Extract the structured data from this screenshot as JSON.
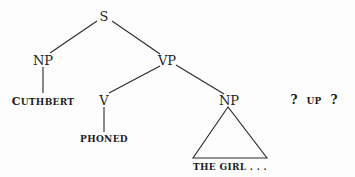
{
  "diagram": {
    "type": "syntax-tree",
    "nodes": {
      "s": "S",
      "np_subject": "NP",
      "vp": "VP",
      "cuthbert": "UTHBERT",
      "cuthbert_initial": "C",
      "v": "V",
      "phoned": "PHONED",
      "np_object": "NP",
      "the_girl": "THE GIRL . . .",
      "q1": "?",
      "up": "UP",
      "q2": "?"
    },
    "colors": {
      "ink": "#1e1e1e",
      "background": "#fdfdfd"
    }
  }
}
